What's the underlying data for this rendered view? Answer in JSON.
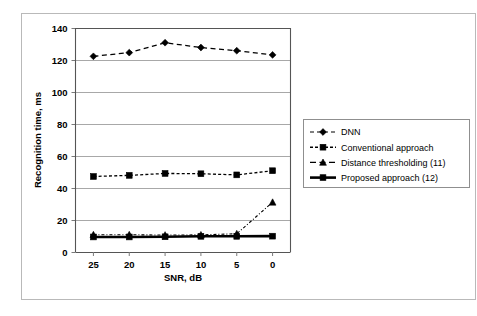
{
  "figure": {
    "background_color": "#ffffff",
    "frame_color": "#b9b9b9"
  },
  "chart_data": {
    "type": "line",
    "title": "",
    "xlabel": "SNR, dB",
    "ylabel": "Recognition time, ms",
    "categories": [
      "25",
      "20",
      "15",
      "10",
      "5",
      "0"
    ],
    "x": [
      25,
      20,
      15,
      10,
      5,
      0
    ],
    "ylim": [
      0,
      140
    ],
    "yticks": [
      0,
      20,
      40,
      60,
      80,
      100,
      120,
      140
    ],
    "ytick_labels": [
      "0",
      "20",
      "40",
      "60",
      "80",
      "100",
      "120",
      "140"
    ],
    "grid": "horizontal",
    "legend_position": "right-outside",
    "series": [
      {
        "name": "DNN",
        "values": [
          122.3,
          124.6,
          130.8,
          127.8,
          125.8,
          123.2
        ],
        "marker": "diamond",
        "line_style": "dashed-light",
        "color": "#000000"
      },
      {
        "name": "Conventional approach",
        "values": [
          47.2,
          47.9,
          49.1,
          48.9,
          48.2,
          50.8
        ],
        "marker": "square",
        "line_style": "dashed",
        "color": "#000000"
      },
      {
        "name": "Distance thresholding (11)",
        "values": [
          10.8,
          10.8,
          10.6,
          10.7,
          11.4,
          31.1
        ],
        "marker": "triangle",
        "line_style": "dash-dot",
        "color": "#000000"
      },
      {
        "name": "Proposed approach (12)",
        "values": [
          9.4,
          9.4,
          9.5,
          9.8,
          9.8,
          9.9
        ],
        "marker": "square",
        "line_style": "solid-thick",
        "color": "#000000"
      }
    ]
  },
  "legend": {
    "entries": [
      {
        "label": "DNN",
        "marker": "diamond-marker",
        "style": "dotted"
      },
      {
        "label": "Conventional approach",
        "marker": "square-marker",
        "style": "dashed"
      },
      {
        "label": "Distance thresholding (11)",
        "marker": "triangle-marker",
        "style": "dashed-long"
      },
      {
        "label": "Proposed approach (12)",
        "marker": "square-marker",
        "style": "solid"
      }
    ]
  }
}
